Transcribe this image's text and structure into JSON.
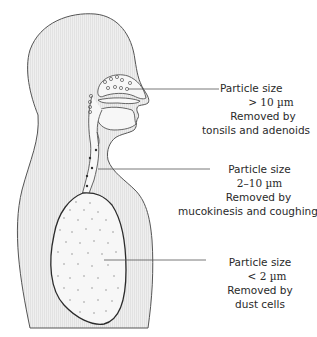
{
  "diagram": {
    "title": "",
    "colors": {
      "body_fill": "#ececec",
      "outline": "#555555",
      "lung_outline": "#2b2b2b",
      "lung_fill": "#f7f7f7",
      "particle": "#888888",
      "leader_line": "#555555",
      "text": "#2a2a2a"
    },
    "annotations": [
      {
        "region": "nasal cavity / pharynx",
        "size_label": "Particle size",
        "size_value": "> 10 µm",
        "removed_label": "Removed by",
        "mechanism": "tonsils and adenoids"
      },
      {
        "region": "trachea / bronchi",
        "size_label": "Particle size",
        "size_value": "2–10 µm",
        "removed_label": "Removed by",
        "mechanism": "mucokinesis and coughing"
      },
      {
        "region": "lung / alveoli",
        "size_label": "Particle size",
        "size_value": "< 2 µm",
        "removed_label": "Removed by",
        "mechanism": "dust cells"
      }
    ]
  }
}
